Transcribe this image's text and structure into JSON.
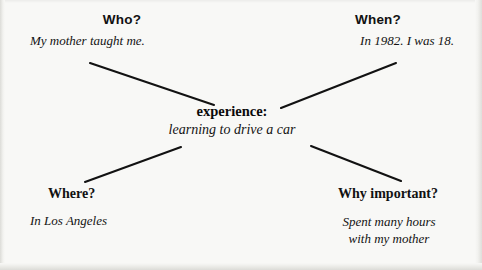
{
  "diagram": {
    "type": "cluster-map",
    "background_color": "#f8f8f6",
    "line_color": "#121212",
    "center": {
      "term": "experience:",
      "description": "learning to drive a car"
    },
    "branches": [
      {
        "id": "who",
        "position": "top-left",
        "question": "Who?",
        "answer": "My mother taught me.",
        "answer_lines": [
          "My mother taught me."
        ]
      },
      {
        "id": "when",
        "position": "top-right",
        "question": "When?",
        "answer": "In 1982. I was 18.",
        "answer_lines": [
          "In 1982. I was 18."
        ]
      },
      {
        "id": "where",
        "position": "bottom-left",
        "question": "Where?",
        "answer": "In Los Angeles",
        "answer_lines": [
          "In Los Angeles"
        ]
      },
      {
        "id": "why-important",
        "position": "bottom-right",
        "question": "Why important?",
        "answer": "Spent many hours with my mother",
        "answer_lines": [
          "Spent many hours",
          "with my mother"
        ]
      }
    ],
    "connectors": [
      {
        "name": "connector-who",
        "x1": 90,
        "y1": 63,
        "x2": 214,
        "y2": 105
      },
      {
        "name": "connector-when",
        "x1": 281,
        "y1": 108,
        "x2": 396,
        "y2": 63
      },
      {
        "name": "connector-where",
        "x1": 85,
        "y1": 182,
        "x2": 181,
        "y2": 147
      },
      {
        "name": "connector-why",
        "x1": 311,
        "y1": 146,
        "x2": 401,
        "y2": 181
      }
    ]
  }
}
